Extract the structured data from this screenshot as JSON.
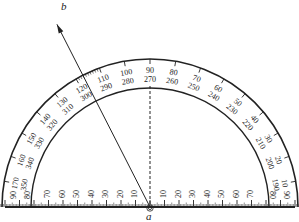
{
  "diagram": {
    "title": "",
    "points": {
      "a": "a",
      "b": "b"
    },
    "ray_ab_angle_degrees_inner_scale": 117,
    "outer_scale": {
      "labels": [
        "10",
        "20",
        "30",
        "40",
        "50",
        "60",
        "70",
        "80",
        "90",
        "100",
        "110",
        "120",
        "130",
        "140",
        "150",
        "160",
        "170"
      ],
      "label_values_deg": [
        10,
        20,
        30,
        40,
        50,
        60,
        70,
        80,
        90,
        100,
        110,
        120,
        130,
        140,
        150,
        160,
        170
      ]
    },
    "inner_scale": {
      "labels": [
        "190",
        "200",
        "210",
        "220",
        "230",
        "240",
        "250",
        "260",
        "270",
        "280",
        "290",
        "300",
        "310",
        "320",
        "330",
        "340",
        "350"
      ],
      "label_values_deg": [
        10,
        20,
        30,
        40,
        50,
        60,
        70,
        80,
        90,
        100,
        110,
        120,
        130,
        140,
        150,
        160,
        170
      ]
    },
    "end_labels": {
      "left_outer": "90",
      "left_inner": "80",
      "right_outer": "90",
      "right_inner": "80"
    },
    "ruler": {
      "left_labels": [
        "70",
        "60",
        "50",
        "40",
        "30",
        "20",
        "10"
      ],
      "right_labels": [
        "10",
        "20",
        "30",
        "40",
        "50",
        "60",
        "70"
      ]
    },
    "colors": {
      "line": "#222222",
      "background": "#ffffff"
    }
  }
}
